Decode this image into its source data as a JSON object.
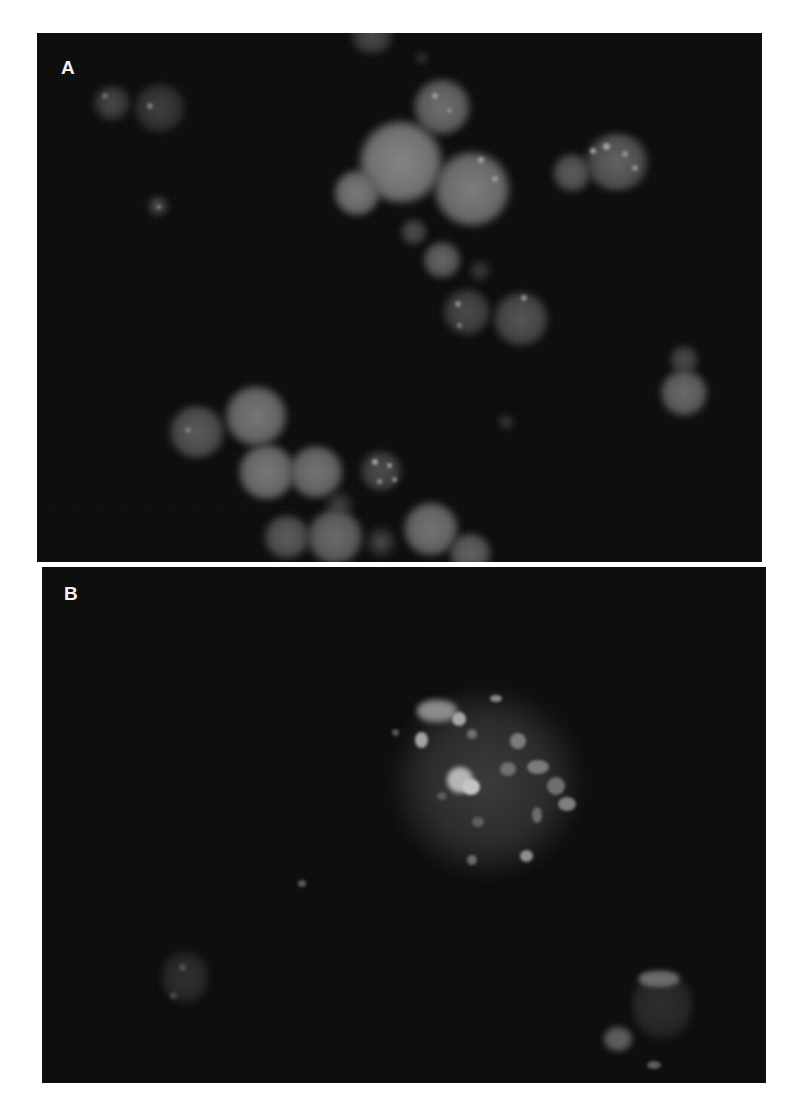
{
  "figure": {
    "panels": [
      {
        "id": "A",
        "label": "A",
        "content": "fluorescence micrograph of clustered round nuclei, some with bright punctate foci"
      },
      {
        "id": "B",
        "label": "B",
        "content": "fluorescence micrograph of a large cell with many bright fragmented foci and a few faint small cells"
      }
    ],
    "colors": {
      "background": "#ffffff",
      "panel_background": "#0c0c0c",
      "signal": "#8a8a8a",
      "label": "#f2f2f2"
    }
  }
}
